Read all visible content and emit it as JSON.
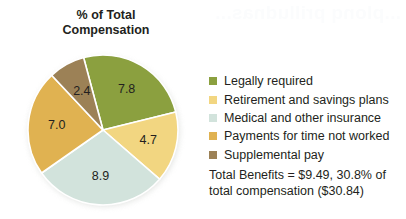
{
  "chart_data": {
    "type": "pie",
    "title": "% of Total Compensation",
    "title_line1": "% of Total",
    "title_line2": "Compensation",
    "categories": [
      "Legally required",
      "Retirement and savings plans",
      "Medical and other insurance",
      "Payments for time not worked",
      "Supplemental pay"
    ],
    "values": [
      7.8,
      4.7,
      8.9,
      7.0,
      2.4
    ],
    "value_labels": [
      "7.8",
      "4.7",
      "8.9",
      "7.0",
      "2.4"
    ],
    "colors": [
      "#8BA03F",
      "#F2D681",
      "#D2E3DC",
      "#E0B251",
      "#9C8156"
    ],
    "unit": "percent of total compensation",
    "total": 30.8,
    "legend_position": "right",
    "grid": false,
    "annotation": "Total Benefits = $9.49, 30.8% of total compensation ($30.84)",
    "slices": [
      {
        "label": "Legally required",
        "value": 7.8,
        "color": "#8BA03F",
        "start_angle": -15.0,
        "end_angle": 76.1
      },
      {
        "label": "Retirement and savings plans",
        "value": 4.7,
        "color": "#F2D681",
        "start_angle": 76.1,
        "end_angle": 131.0
      },
      {
        "label": "Medical and other insurance",
        "value": 8.9,
        "color": "#D2E3DC",
        "start_angle": 131.0,
        "end_angle": 235.0
      },
      {
        "label": "Payments for time not worked",
        "value": 7.0,
        "color": "#E0B251",
        "start_angle": 235.0,
        "end_angle": 316.8
      },
      {
        "label": "Supplemental pay",
        "value": 2.4,
        "color": "#9C8156",
        "start_angle": 316.8,
        "end_angle": 345.0
      }
    ]
  },
  "summary": {
    "line1": "Total Benefits = $9.49, 30.8% of",
    "line2": "total compensation ($30.84)"
  },
  "background": {
    "bleed_text": "...plonq prilludnas..."
  }
}
